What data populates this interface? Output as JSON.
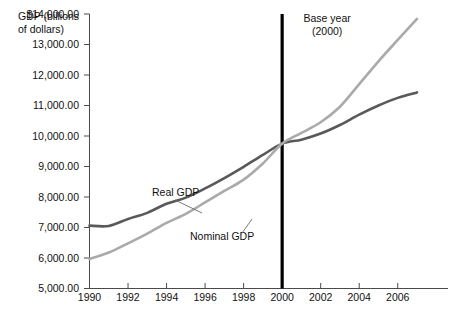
{
  "chart_data": {
    "type": "line",
    "title": "",
    "subtitle": "",
    "xlabel": "",
    "ylabel": "GDP (billions of dollars)",
    "ylabel_lines": [
      "GDP (billions",
      "of dollars)"
    ],
    "xlim": [
      1990,
      2007
    ],
    "ylim": [
      5000,
      14000
    ],
    "grid": false,
    "legend_position": "inline-annotations",
    "x": [
      1990,
      1991,
      1992,
      1993,
      1994,
      1995,
      1996,
      1997,
      1998,
      1999,
      2000,
      2001,
      2002,
      2003,
      2004,
      2005,
      2006,
      2007
    ],
    "y_ticks": [
      5000,
      6000,
      7000,
      8000,
      9000,
      10000,
      11000,
      12000,
      13000,
      14000
    ],
    "y_tick_labels": [
      "5,000.00",
      "6,000.00",
      "7,000.00",
      "8,000.00",
      "9,000.00",
      "10,000.00",
      "11,000.00",
      "12,000.00",
      "13,000.00",
      "$14,000.00"
    ],
    "x_ticks": [
      1990,
      1992,
      1994,
      1996,
      1998,
      2000,
      2002,
      2004,
      2006
    ],
    "x_tick_labels": [
      "1990",
      "1992",
      "1994",
      "1996",
      "1998",
      "2000",
      "2002",
      "2004",
      "2006"
    ],
    "series": [
      {
        "name": "Real GDP",
        "label": "Real GDP",
        "color": "#595959",
        "width": 2.6,
        "values": [
          7060,
          7050,
          7280,
          7480,
          7780,
          7980,
          8280,
          8620,
          8990,
          9380,
          9750,
          9880,
          10080,
          10360,
          10700,
          11000,
          11250,
          11430
        ]
      },
      {
        "name": "Nominal GDP",
        "label": "Nominal GDP",
        "color": "#aaaaaa",
        "width": 2.6,
        "values": [
          5970,
          6180,
          6480,
          6800,
          7150,
          7450,
          7820,
          8200,
          8570,
          9100,
          9750,
          10100,
          10450,
          10960,
          11700,
          12450,
          13150,
          13840
        ]
      }
    ],
    "annotations": [
      {
        "name": "base-year",
        "lines": [
          "Base year",
          "(2000)"
        ],
        "at_x": 2000,
        "marker_color": "#000000"
      }
    ],
    "series_label_positions": [
      {
        "series": "Real GDP",
        "text_x": 152,
        "text_y": 196,
        "leader": [
          [
            175,
            200
          ],
          [
            202,
            213
          ]
        ]
      },
      {
        "series": "Nominal GDP",
        "text_x": 190,
        "text_y": 240,
        "leader": [
          [
            240,
            236
          ],
          [
            252,
            219
          ]
        ]
      }
    ]
  }
}
